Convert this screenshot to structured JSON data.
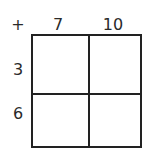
{
  "table": {
    "operator": "+",
    "columns": [
      "7",
      "10"
    ],
    "rows": [
      "3",
      "6"
    ],
    "cells": [
      [
        "",
        ""
      ],
      [
        "",
        ""
      ]
    ]
  }
}
